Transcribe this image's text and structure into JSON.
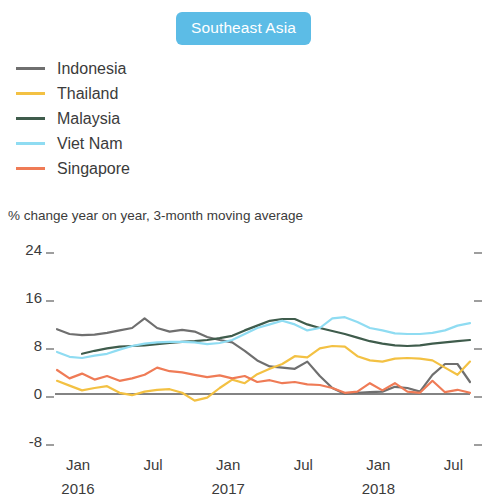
{
  "header": {
    "badge_label": "Southeast Asia",
    "badge_color": "#5cbce6",
    "badge_text_color": "#ffffff"
  },
  "legend": {
    "position": "top-left",
    "items": [
      {
        "label": "Indonesia",
        "color": "#6f6f6f"
      },
      {
        "label": "Thailand",
        "color": "#f3c143"
      },
      {
        "label": "Malaysia",
        "color": "#3f5c4c"
      },
      {
        "label": "Viet Nam",
        "color": "#8fdcf2"
      },
      {
        "label": "Singapore",
        "color": "#ef7b56"
      }
    ]
  },
  "subtitle": "% change year on year, 3-month moving average",
  "axes": {
    "y_ticks": [
      "24",
      "16",
      "8",
      "0",
      "-8"
    ],
    "x_ticks": [
      {
        "month": "Jan",
        "year": "2016"
      },
      {
        "month": "Jul",
        "year": ""
      },
      {
        "month": "Jan",
        "year": "2017"
      },
      {
        "month": "Jul",
        "year": ""
      },
      {
        "month": "Jan",
        "year": "2018"
      },
      {
        "month": "Jul",
        "year": ""
      }
    ]
  },
  "chart_data": {
    "type": "line",
    "title": "Southeast Asia",
    "subtitle": "% change year on year, 3-month moving average",
    "xlabel": "",
    "ylabel": "% change year on year, 3-month moving average",
    "ylim": [
      -8,
      24
    ],
    "y_ticks": [
      -8,
      0,
      8,
      16,
      24
    ],
    "grid": false,
    "zero_line": true,
    "legend_position": "top-left",
    "x": [
      "Jan 2016",
      "Feb 2016",
      "Mar 2016",
      "Apr 2016",
      "May 2016",
      "Jun 2016",
      "Jul 2016",
      "Aug 2016",
      "Sep 2016",
      "Oct 2016",
      "Nov 2016",
      "Dec 2016",
      "Jan 2017",
      "Feb 2017",
      "Mar 2017",
      "Apr 2017",
      "May 2017",
      "Jun 2017",
      "Jul 2017",
      "Aug 2017",
      "Sep 2017",
      "Oct 2017",
      "Nov 2017",
      "Dec 2017",
      "Jan 2018",
      "Feb 2018",
      "Mar 2018",
      "Apr 2018",
      "May 2018",
      "Jun 2018",
      "Jul 2018",
      "Aug 2018",
      "Sep 2018",
      "Oct 2018"
    ],
    "x_tick_labels": [
      "Jan 2016",
      "Jul",
      "Jan 2017",
      "Jul",
      "Jan 2018",
      "Jul"
    ],
    "x_tick_indices": [
      0,
      6,
      12,
      18,
      24,
      30
    ],
    "series": [
      {
        "name": "Indonesia",
        "color": "#6f6f6f",
        "values": [
          10.8,
          10.0,
          9.8,
          9.9,
          10.2,
          10.6,
          11.0,
          12.6,
          11.0,
          10.4,
          10.7,
          10.4,
          9.5,
          9.0,
          8.6,
          7.2,
          5.6,
          4.6,
          4.4,
          4.2,
          5.4,
          3.0,
          1.0,
          0.0,
          0.2,
          0.3,
          0.4,
          1.2,
          1.0,
          0.4,
          3.2,
          5.0,
          5.0,
          2.0
        ]
      },
      {
        "name": "Thailand",
        "color": "#f3c143",
        "values": [
          2.2,
          1.4,
          0.6,
          1.0,
          1.3,
          0.2,
          -0.2,
          0.4,
          0.7,
          0.8,
          0.2,
          -1.1,
          -0.6,
          1.0,
          2.4,
          1.8,
          3.3,
          4.2,
          5.0,
          6.3,
          6.1,
          7.6,
          8.0,
          7.9,
          6.3,
          5.6,
          5.4,
          5.9,
          6.0,
          5.9,
          5.6,
          4.4,
          3.2,
          5.4
        ]
      },
      {
        "name": "Malaysia",
        "color": "#3f5c4c",
        "values": [
          null,
          null,
          6.7,
          7.2,
          7.6,
          7.9,
          8.0,
          8.1,
          8.3,
          8.5,
          8.7,
          8.8,
          9.0,
          9.3,
          9.7,
          10.6,
          11.4,
          12.2,
          12.5,
          12.5,
          11.6,
          11.0,
          10.5,
          10.0,
          9.4,
          8.8,
          8.4,
          8.1,
          8.0,
          8.1,
          8.4,
          8.6,
          8.8,
          9.0
        ]
      },
      {
        "name": "Viet Nam",
        "color": "#8fdcf2",
        "values": [
          7.0,
          6.2,
          6.0,
          6.4,
          6.7,
          7.4,
          8.0,
          8.4,
          8.6,
          8.7,
          8.7,
          8.6,
          8.3,
          8.5,
          9.0,
          10.0,
          11.0,
          11.6,
          12.2,
          11.6,
          10.6,
          11.0,
          12.6,
          12.8,
          12.0,
          11.0,
          10.6,
          10.1,
          10.0,
          10.0,
          10.2,
          10.6,
          11.4,
          11.8
        ]
      },
      {
        "name": "Singapore",
        "color": "#ef7b56",
        "values": [
          4.0,
          2.6,
          3.4,
          2.4,
          3.0,
          2.2,
          2.6,
          3.2,
          4.4,
          3.8,
          3.6,
          3.2,
          2.8,
          3.1,
          2.6,
          3.0,
          2.0,
          2.3,
          1.8,
          2.0,
          1.6,
          1.5,
          1.0,
          0.2,
          0.4,
          1.8,
          0.6,
          1.8,
          0.4,
          0.2,
          2.2,
          0.3,
          0.7,
          0.2
        ]
      }
    ]
  }
}
